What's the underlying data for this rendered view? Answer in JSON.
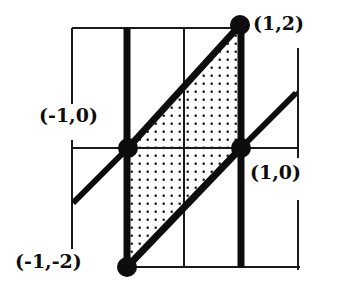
{
  "figure": {
    "type": "geometry-diagram",
    "colors": {
      "ink": "#0d0d0d",
      "thin_line": "#1a1a1a",
      "background": "#ffffff",
      "shading_dot": "#0d0d0d"
    },
    "labels": [
      {
        "id": "p12",
        "text": "(1,2)",
        "name": "point-label-1-2"
      },
      {
        "id": "pm10",
        "text": "(-1,0)",
        "name": "point-label-neg1-0"
      },
      {
        "id": "p10",
        "text": "(1,0)",
        "name": "point-label-1-0"
      },
      {
        "id": "pm1m2",
        "text": "(-1,-2)",
        "name": "point-label-neg1-neg2"
      }
    ],
    "vertices": [
      {
        "label": "(1,2)",
        "px": 240,
        "py": 25
      },
      {
        "label": "(-1,0)",
        "px": 128,
        "py": 148
      },
      {
        "label": "(1,0)",
        "px": 241,
        "py": 148
      },
      {
        "label": "(-1,-2)",
        "px": 127,
        "py": 267
      }
    ],
    "grid": {
      "vertical_thin_x": [
        72,
        184,
        298
      ],
      "horizontal_thin_y": [
        28,
        148,
        267
      ],
      "vertical_thick_x": [
        127,
        241
      ]
    },
    "shading": {
      "pattern": "dots",
      "spacing": 8
    }
  }
}
